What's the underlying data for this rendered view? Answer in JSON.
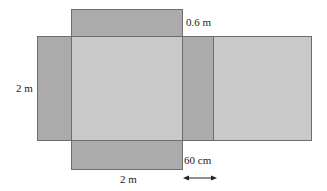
{
  "diagram": {
    "type": "net",
    "colors": {
      "face_light": "#c9c9c9",
      "flap_dark": "#ababab",
      "border": "#6e6e6e",
      "text": "#222222"
    },
    "panels": [
      {
        "name": "top-flap",
        "shade": "dark"
      },
      {
        "name": "left-flap",
        "shade": "dark"
      },
      {
        "name": "center-face",
        "shade": "light"
      },
      {
        "name": "right-flap",
        "shade": "dark"
      },
      {
        "name": "right-face",
        "shade": "light"
      },
      {
        "name": "bottom-flap",
        "shade": "dark"
      }
    ],
    "labels": {
      "top_flap_height": "0.6 m",
      "left_height": "2 m",
      "bottom_width": "2 m",
      "flap_width": "60 cm"
    }
  }
}
